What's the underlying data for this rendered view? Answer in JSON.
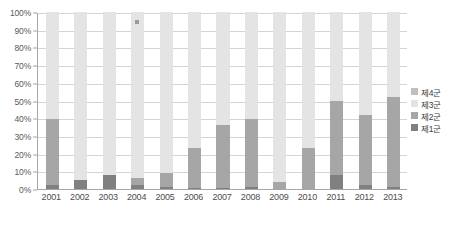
{
  "chart_data": {
    "type": "bar",
    "subtype": "stacked-column-100",
    "title": "",
    "subtitle": "",
    "xlabel": "",
    "ylabel": "",
    "grid": true,
    "legend_position": "right",
    "ylim": [
      0,
      100
    ],
    "y_tick_labels": [
      "0%",
      "10%",
      "20%",
      "30%",
      "40%",
      "50%",
      "60%",
      "70%",
      "80%",
      "90%",
      "100%"
    ],
    "y_tick_values": [
      0,
      10,
      20,
      30,
      40,
      50,
      60,
      70,
      80,
      90,
      100
    ],
    "categories": [
      "2001",
      "2002",
      "2003",
      "2004",
      "2005",
      "2006",
      "2007",
      "2008",
      "2009",
      "2010",
      "2011",
      "2012",
      "2013"
    ],
    "series": [
      {
        "name": "제1군",
        "color": "#808080",
        "values": [
          2.5,
          5.0,
          8.0,
          2.0,
          1.0,
          0.8,
          0.6,
          1.2,
          0.0,
          0.0,
          8.0,
          2.0,
          1.0
        ]
      },
      {
        "name": "제2군",
        "color": "#a6a6a6",
        "values": [
          37.0,
          0.0,
          0.0,
          4.5,
          8.0,
          22.5,
          35.5,
          38.5,
          4.0,
          23.0,
          42.0,
          40.0,
          51.0
        ]
      },
      {
        "name": "제3군",
        "color": "#e4e4e4",
        "values": [
          60.5,
          95.0,
          92.0,
          93.5,
          91.0,
          76.7,
          63.9,
          60.3,
          96.0,
          77.0,
          50.0,
          58.0,
          48.0
        ]
      },
      {
        "name": "제4군",
        "color": "#bfbfbf",
        "values": [
          0.0,
          0.0,
          0.0,
          0.0,
          0.0,
          0.0,
          0.0,
          0.0,
          0.0,
          0.0,
          0.0,
          0.0,
          0.0
        ]
      }
    ],
    "bar_tops_group2_cumulative": [
      39.5,
      5.0,
      8.0,
      6.5,
      9.0,
      23.3,
      36.1,
      39.7,
      4.0,
      23.0,
      50.0,
      42.0,
      52.0
    ],
    "annotations": [
      {
        "name": "stray-marker",
        "x_category": "2004",
        "y_value": 95,
        "color": "#9a9a9a"
      }
    ]
  },
  "legend": {
    "items": [
      {
        "label": "제4군",
        "color": "#bfbfbf"
      },
      {
        "label": "제3군",
        "color": "#e4e4e4"
      },
      {
        "label": "제2군",
        "color": "#a6a6a6"
      },
      {
        "label": "제1군",
        "color": "#808080"
      }
    ]
  },
  "colors": {
    "background": "#ffffff",
    "gridline": "#d4d4d4",
    "axis": "#a6a6a6",
    "column_band": "#f2f2f2",
    "tick_text": "#5a5a5a",
    "category_text": "#4d4d4d"
  }
}
